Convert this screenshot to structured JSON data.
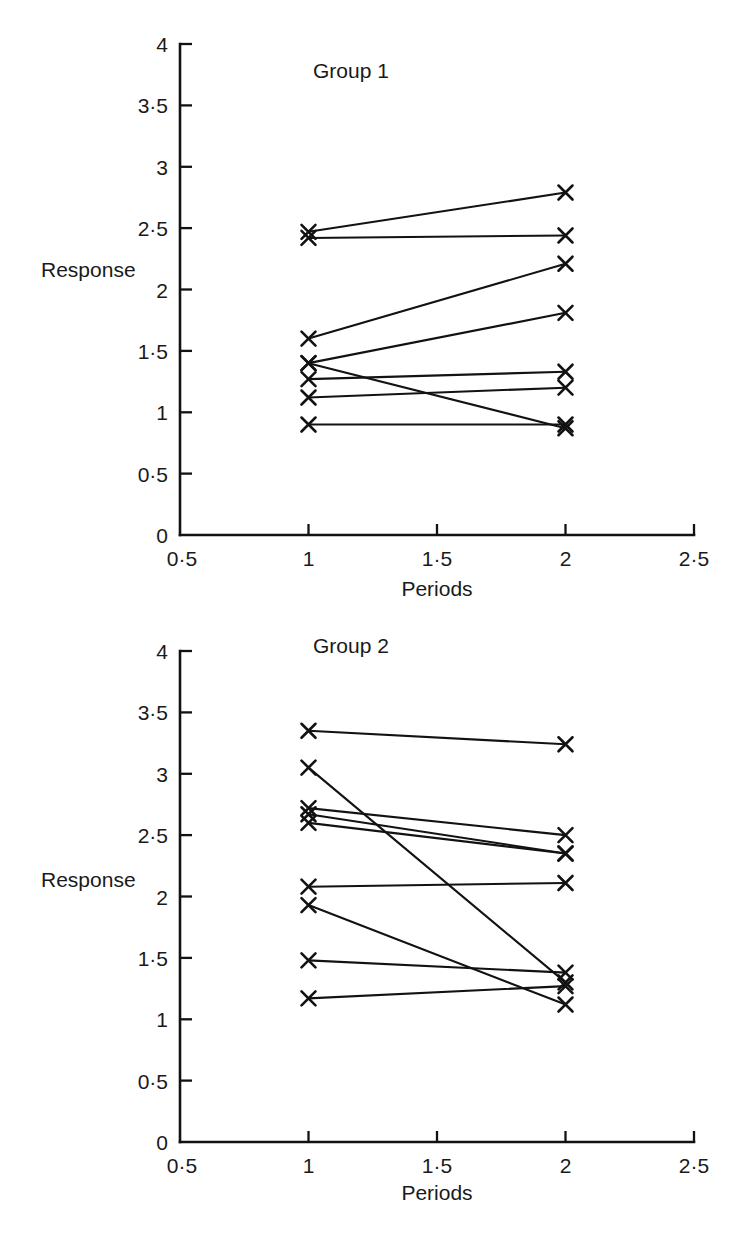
{
  "figure": {
    "background_color": "#ffffff",
    "ink_color": "#121212"
  },
  "chart_data": [
    {
      "type": "line",
      "title": "Group 1",
      "xlabel": "Periods",
      "ylabel": "Response",
      "xlim": [
        0.5,
        2.5
      ],
      "ylim": [
        0,
        4
      ],
      "xticks": [
        0.5,
        1,
        1.5,
        2,
        2.5
      ],
      "xticklabels": [
        "0·5",
        "1",
        "1·5",
        "2",
        "2·5"
      ],
      "yticks": [
        0,
        0.5,
        1,
        1.5,
        2,
        2.5,
        3,
        3.5,
        4
      ],
      "yticklabels": [
        "0",
        "0·5",
        "1",
        "1·5",
        "2",
        "2·5",
        "3",
        "3·5",
        "4"
      ],
      "grid": false,
      "legend": "none",
      "marker": "x",
      "x": [
        1,
        2
      ],
      "series": [
        {
          "name": "subject-1",
          "values": [
            2.47,
            2.79
          ]
        },
        {
          "name": "subject-2",
          "values": [
            2.42,
            2.44
          ]
        },
        {
          "name": "subject-3",
          "values": [
            1.6,
            2.21
          ]
        },
        {
          "name": "subject-4",
          "values": [
            1.4,
            1.81
          ]
        },
        {
          "name": "subject-5",
          "values": [
            1.4,
            0.87
          ]
        },
        {
          "name": "subject-6",
          "values": [
            1.27,
            1.33
          ]
        },
        {
          "name": "subject-7",
          "values": [
            1.12,
            1.2
          ]
        },
        {
          "name": "subject-8",
          "values": [
            0.9,
            0.9
          ]
        }
      ]
    },
    {
      "type": "line",
      "title": "Group 2",
      "xlabel": "Periods",
      "ylabel": "Response",
      "xlim": [
        0.5,
        2.5
      ],
      "ylim": [
        0,
        4
      ],
      "xticks": [
        0.5,
        1,
        1.5,
        2,
        2.5
      ],
      "xticklabels": [
        "0·5",
        "1",
        "1·5",
        "2",
        "2·5"
      ],
      "yticks": [
        0,
        0.5,
        1,
        1.5,
        2,
        2.5,
        3,
        3.5,
        4
      ],
      "yticklabels": [
        "0",
        "0·5",
        "1",
        "1·5",
        "2",
        "2·5",
        "3",
        "3·5",
        "4"
      ],
      "grid": false,
      "legend": "none",
      "marker": "x",
      "x": [
        1,
        2
      ],
      "series": [
        {
          "name": "subject-1",
          "values": [
            3.35,
            3.24
          ]
        },
        {
          "name": "subject-2",
          "values": [
            3.05,
            1.3
          ]
        },
        {
          "name": "subject-3",
          "values": [
            2.72,
            2.5
          ]
        },
        {
          "name": "subject-4",
          "values": [
            2.67,
            2.35
          ]
        },
        {
          "name": "subject-5",
          "values": [
            2.6,
            2.35
          ]
        },
        {
          "name": "subject-6",
          "values": [
            2.08,
            2.11
          ]
        },
        {
          "name": "subject-7",
          "values": [
            1.93,
            1.12
          ]
        },
        {
          "name": "subject-8",
          "values": [
            1.48,
            1.38
          ]
        },
        {
          "name": "subject-9",
          "values": [
            1.17,
            1.27
          ]
        }
      ]
    }
  ]
}
